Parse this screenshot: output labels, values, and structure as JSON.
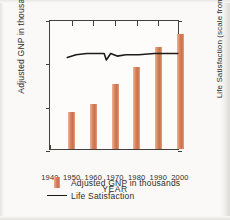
{
  "chart_data": {
    "type": "bar",
    "title": "",
    "xlabel": "YEAR",
    "ylabel": "Adjusted GNP in thousands",
    "y2label": "Life Satisfaction (scale from 0 to 10)",
    "grid": false,
    "legend_position": "bottom-left",
    "xlim": [
      1940,
      2000
    ],
    "ylim": [
      0,
      30
    ],
    "y2lim": [
      0,
      10
    ],
    "xticks": [
      "1940",
      "1950",
      "1960",
      "1970",
      "1980",
      "1990",
      "2000"
    ],
    "xtick_values": [
      1940,
      1950,
      1960,
      1970,
      1980,
      1990,
      2000
    ],
    "yticks": [
      "0",
      "10",
      "20",
      "30"
    ],
    "ytick_values": [
      0,
      10,
      20,
      30
    ],
    "y2ticks": [
      "0",
      "10"
    ],
    "y2tick_values": [
      0,
      10
    ],
    "categories": [
      1950,
      1960,
      1970,
      1980,
      1990,
      2000
    ],
    "series": [
      {
        "name": "Adjusted GNP in thousands",
        "type": "bar",
        "axis": "left",
        "color": "#d8815c",
        "values": [
          8.5,
          10.5,
          15.0,
          19.0,
          23.5,
          26.5
        ]
      },
      {
        "name": "Life Satisfaction",
        "type": "line",
        "axis": "right",
        "color": "#1d1b19",
        "x": [
          1948,
          1952,
          1957,
          1961,
          1965,
          1966,
          1968,
          1971,
          1975,
          1981,
          1988,
          1994,
          1999
        ],
        "values": [
          7.2,
          7.4,
          7.5,
          7.5,
          7.5,
          7.0,
          7.5,
          7.3,
          7.4,
          7.4,
          7.5,
          7.5,
          7.5
        ]
      }
    ]
  },
  "legend": {
    "items": [
      {
        "label": "Adjusted GNP in thousands",
        "marker": "bar-swatch"
      },
      {
        "label": "Life Satisfaction",
        "marker": "line-swatch"
      }
    ]
  }
}
